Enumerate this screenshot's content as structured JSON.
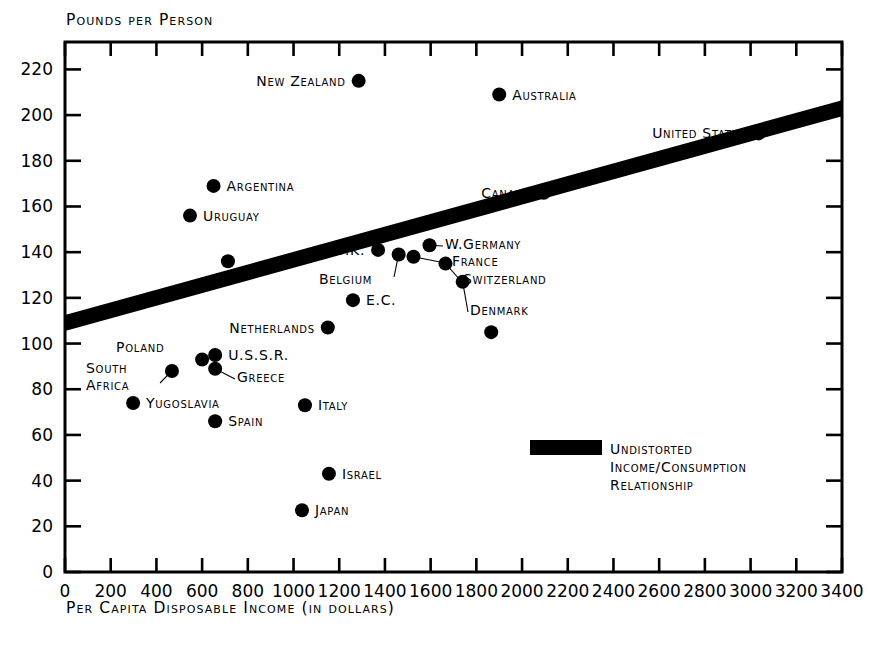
{
  "chart_data": {
    "type": "scatter",
    "title": "",
    "ylabel": "Pounds per Person",
    "xlabel": "Per Capita Disposable Income (in dollars)",
    "xlim": [
      0,
      3400
    ],
    "ylim": [
      0,
      232
    ],
    "xticks": [
      0,
      200,
      400,
      600,
      800,
      1000,
      1200,
      1400,
      1600,
      1800,
      2000,
      2200,
      2400,
      2600,
      2800,
      3000,
      3200,
      3400
    ],
    "yticks": [
      0,
      20,
      40,
      60,
      80,
      100,
      120,
      140,
      160,
      180,
      200,
      220
    ],
    "grid": false,
    "legend_position": "inside-lower-right",
    "points": [
      {
        "name": "New Zealand",
        "x": 1285,
        "y": 215,
        "label_side": "left"
      },
      {
        "name": "Australia",
        "x": 1900,
        "y": 209,
        "label_side": "right"
      },
      {
        "name": "Argentina",
        "x": 650,
        "y": 169,
        "label_side": "right"
      },
      {
        "name": "Uruguay",
        "x": 547,
        "y": 156,
        "label_side": "right"
      },
      {
        "name": "Canada",
        "x": 2095,
        "y": 166,
        "label_side": "left"
      },
      {
        "name": "United States",
        "x": 3035,
        "y": 192,
        "label_side": "left"
      },
      {
        "name": "U.K.",
        "x": 1370,
        "y": 141,
        "label_side": "left"
      },
      {
        "name": "W.Germany",
        "x": 1595,
        "y": 143,
        "label_side": "leader"
      },
      {
        "name": "Belgium",
        "x": 1460,
        "y": 139,
        "label_side": "leader"
      },
      {
        "name": "France",
        "x": 1525,
        "y": 138,
        "label_side": "leader"
      },
      {
        "name": "Switzerland",
        "x": 1665,
        "y": 135,
        "label_side": "leader"
      },
      {
        "name": "Denmark",
        "x": 1740,
        "y": 127,
        "label_side": "leader"
      },
      {
        "name": "E.C.",
        "x": 1260,
        "y": 119,
        "label_side": "right"
      },
      {
        "name": "Netherlands",
        "x": 1150,
        "y": 107,
        "label_side": "left"
      },
      {
        "name": "Poland",
        "x": 600,
        "y": 93,
        "label_side": "leader"
      },
      {
        "name": "U.S.S.R.",
        "x": 657,
        "y": 95,
        "label_side": "right"
      },
      {
        "name": "Greece",
        "x": 657,
        "y": 89,
        "label_side": "leader"
      },
      {
        "name": "South Africa",
        "x": 468,
        "y": 88,
        "label_side": "leader"
      },
      {
        "name": "Yugoslavia",
        "x": 298,
        "y": 74,
        "label_side": "right"
      },
      {
        "name": "Spain",
        "x": 657,
        "y": 66,
        "label_side": "right"
      },
      {
        "name": "Italy",
        "x": 1050,
        "y": 73,
        "label_side": "right"
      },
      {
        "name": "Israel",
        "x": 1155,
        "y": 43,
        "label_side": "right"
      },
      {
        "name": "Japan",
        "x": 1037,
        "y": 27,
        "label_side": "right"
      },
      {
        "name": "",
        "x": 713,
        "y": 136,
        "label_side": "none"
      },
      {
        "name": "",
        "x": 1865,
        "y": 105,
        "label_side": "none"
      }
    ],
    "trend_band": {
      "label": "Undistorted Income/Consumption Relationship",
      "x_start": 0,
      "y_start": 109,
      "x_end": 3400,
      "y_end": 203,
      "thickness_units": 7
    },
    "legend": {
      "swatch_color": "#000000",
      "lines": [
        "Undistorted",
        "Income/Consumption",
        "Relationship"
      ]
    }
  }
}
